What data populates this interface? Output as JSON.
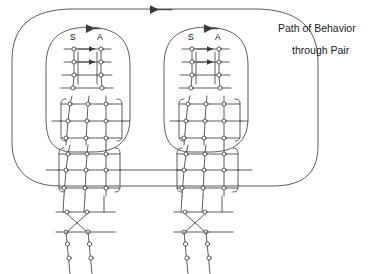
{
  "figure": {
    "title": "Path of Behavior through Pair",
    "type": "schematic-network-diagram",
    "background_color": "#ffffff",
    "line_color": "#444444",
    "text_color": "#111111"
  },
  "caption": {
    "line1": "Path of Behavior",
    "line2": "through Pair"
  },
  "units": [
    {
      "id": "left-unit",
      "labels": {
        "s": "S",
        "a": "A"
      },
      "center_x": 88,
      "loop_arrow_direction": "left"
    },
    {
      "id": "right-unit",
      "labels": {
        "s": "S",
        "a": "A"
      },
      "center_x": 206,
      "loop_arrow_direction": "left"
    }
  ],
  "outer_path": {
    "name": "path-of-behavior-loop",
    "arrow_direction": "left",
    "arrow_x": 155,
    "arrow_y": 12
  },
  "structure": {
    "top_ladder_rows": 3,
    "top_ladder_columns": 2,
    "inner_arrows_per_ladder": 2,
    "grid_rows": 3,
    "grid_columns": 3,
    "grids_per_unit": 2,
    "crossover_bars": 2,
    "legs_per_unit": 2,
    "circles_per_leg": 2,
    "bridge_line_y": 170
  },
  "colors": {
    "stroke": "#444444",
    "node_fill": "#ffffff",
    "text": "#111111"
  }
}
